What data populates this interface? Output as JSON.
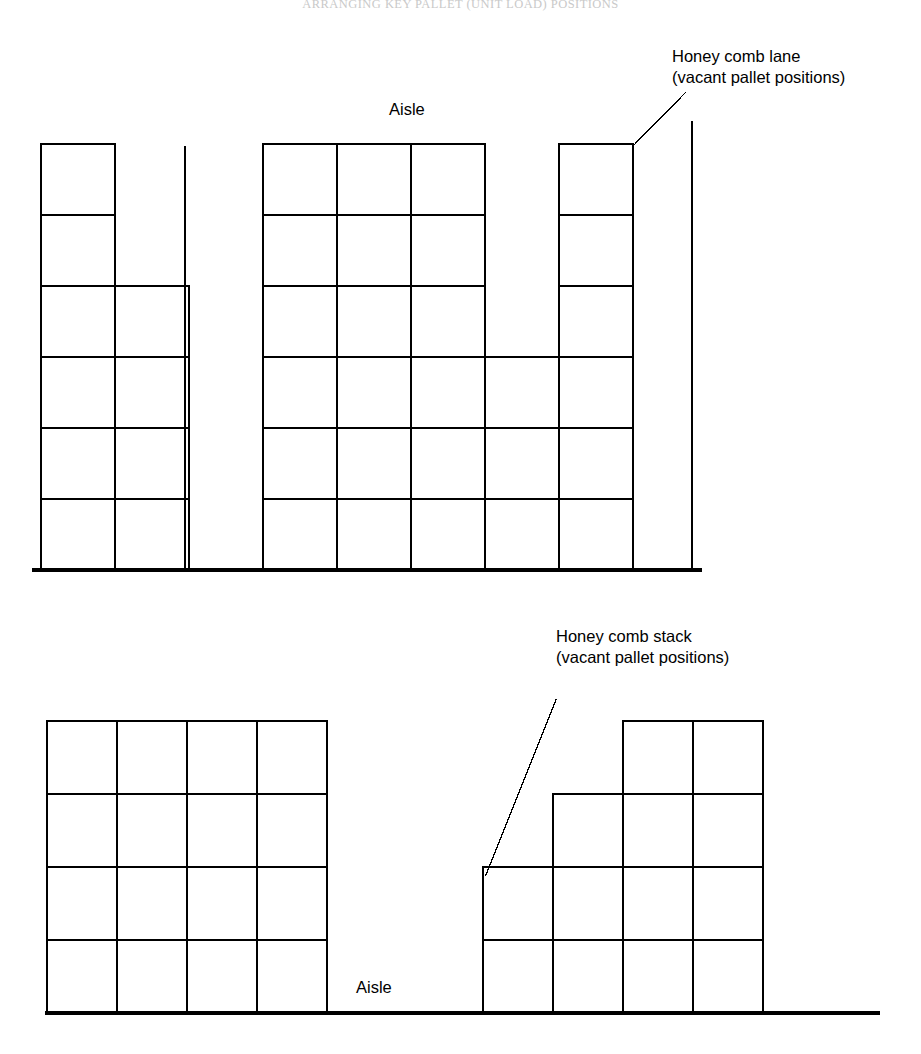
{
  "page": {
    "running_head": "ARRANGING KEY PALLET (UNIT LOAD) POSITIONS",
    "width": 921,
    "height": 1054,
    "background": "#ffffff",
    "line_color": "#000000"
  },
  "figure_top": {
    "name": "honey-comb-lane-diagram",
    "aisle_label": "Aisle",
    "callout": {
      "line1": "Honey comb lane",
      "line2": "(vacant pallet positions)"
    },
    "geometry": {
      "left": 41,
      "right": 633,
      "top": 145,
      "baseline": 570,
      "cell_w": 74,
      "cell_h": 71,
      "rows": 6,
      "cols": 8,
      "right_wall_x": 692,
      "right_wall_top": 122,
      "floor_left": 34,
      "floor_right": 700
    },
    "column_heights": [
      6,
      4,
      0,
      6,
      6,
      6,
      3,
      6
    ],
    "empty_lane_column": 3,
    "lane_divider_x": 185,
    "lane_divider_top": 147,
    "leader": {
      "x1": 633,
      "y1": 146,
      "x2": 686,
      "y2": 92
    }
  },
  "figure_bottom": {
    "name": "honey-comb-stack-diagram",
    "aisle_label": "Aisle",
    "callout": {
      "line1": "Honey comb stack",
      "line2": "(vacant pallet positions)"
    },
    "geometry": {
      "baseline": 1013,
      "floor_left": 47,
      "floor_right": 878,
      "cell_w": 70,
      "cell_h": 73
    },
    "left_block": {
      "left": 47,
      "top": 721,
      "rows": 4,
      "cols": 4,
      "column_heights": [
        4,
        4,
        4,
        4
      ]
    },
    "right_block": {
      "left": 483,
      "cols": 4,
      "column_heights": [
        2,
        3,
        4,
        4
      ]
    },
    "leader": {
      "x1": 486,
      "y1": 875,
      "x2": 556,
      "y2": 700
    }
  }
}
